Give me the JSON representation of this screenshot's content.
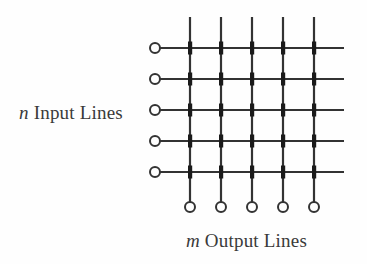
{
  "figure": {
    "name": "crossbar-switch-diagram",
    "labels": {
      "input": {
        "variable": "n",
        "text": " Input Lines"
      },
      "output": {
        "variable": "m",
        "text": " Output Lines"
      }
    },
    "colors": {
      "background": "#fefefe",
      "line": "#333333",
      "crosspoint": "#1a1a1a",
      "terminal_fill": "#ffffff",
      "terminal_stroke": "#333333",
      "text": "#3a3a3a"
    },
    "grid": {
      "input_count": 5,
      "output_count": 5,
      "crosspoint_count": 25,
      "input_line_y": [
        48,
        79,
        110,
        141,
        172
      ],
      "output_line_x": [
        190,
        221,
        252,
        283,
        314
      ],
      "input_terminal_x": 155,
      "output_terminal_y": 207,
      "horizontal_line_end_x": 344,
      "vertical_line_start_y": 17,
      "terminal_radius": 5,
      "line_width": 2,
      "crosspoint_width": 4,
      "crosspoint_height": 13
    }
  }
}
